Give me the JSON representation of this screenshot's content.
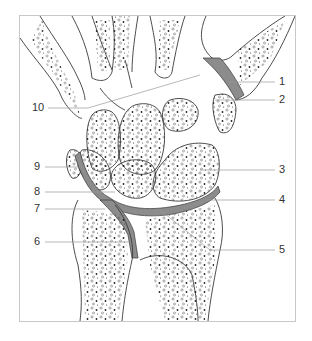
{
  "diagram": {
    "colors": {
      "outline": "#3a3a3a",
      "cartilage_fill": "#8c8c8c",
      "leader_line": "#9a9a9a",
      "frame": "#c8c8c8",
      "label_text": "#333333"
    },
    "labels": [
      {
        "id": "1",
        "text": "1",
        "side": "right"
      },
      {
        "id": "2",
        "text": "2",
        "side": "right"
      },
      {
        "id": "3",
        "text": "3",
        "side": "right"
      },
      {
        "id": "4",
        "text": "4",
        "side": "right"
      },
      {
        "id": "5",
        "text": "5",
        "side": "right"
      },
      {
        "id": "6",
        "text": "6",
        "side": "left"
      },
      {
        "id": "7",
        "text": "7",
        "side": "left"
      },
      {
        "id": "8",
        "text": "8",
        "side": "left"
      },
      {
        "id": "9",
        "text": "9",
        "side": "left"
      },
      {
        "id": "10",
        "text": "10",
        "side": "left"
      }
    ]
  }
}
